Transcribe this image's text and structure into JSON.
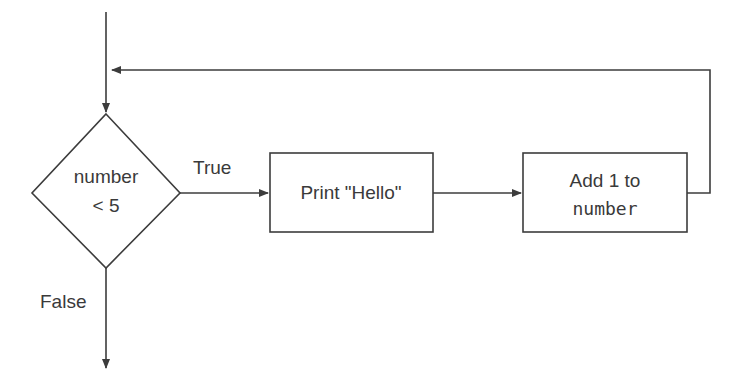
{
  "diagram": {
    "type": "flowchart",
    "nodes": {
      "decision": {
        "line1": "number",
        "line2": "< 5"
      },
      "print": {
        "label": "Print \"Hello\""
      },
      "add": {
        "line1": "Add 1 to",
        "line2": "number"
      }
    },
    "edges": {
      "true_label": "True",
      "false_label": "False"
    },
    "colors": {
      "line": "#3c3c3c",
      "text": "#3a3a3a",
      "background": "#ffffff"
    }
  }
}
